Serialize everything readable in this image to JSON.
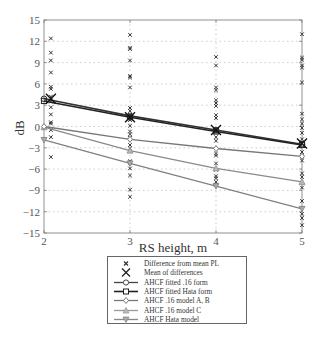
{
  "chart_data": {
    "type": "line",
    "title": "",
    "xlabel": "RS height, m",
    "ylabel": "dB",
    "xlim": [
      2,
      5
    ],
    "ylim": [
      -15,
      15
    ],
    "x_ticks": [
      2,
      3,
      4,
      5
    ],
    "y_ticks": [
      15,
      12,
      9,
      6,
      3,
      0,
      -3,
      -6,
      -9,
      -12,
      -15
    ],
    "y_tick_labels": [
      "15",
      "12",
      "9",
      "6",
      "3",
      "0",
      "−3",
      "−6",
      "−9",
      "−12",
      "−15"
    ],
    "grid": true,
    "x": [
      2,
      3,
      4,
      5
    ],
    "series": [
      {
        "name": "AHCF fitted .16 form",
        "marker": "circle",
        "color": "#333333",
        "values": [
          3.9,
          1.5,
          -0.5,
          -2.5
        ]
      },
      {
        "name": "AHCF fitted Hata form",
        "marker": "square",
        "color": "#222222",
        "values": [
          3.6,
          1.3,
          -0.7,
          -2.6
        ]
      },
      {
        "name": "AHCF .16 model A, B",
        "marker": "diamond",
        "color": "#777777",
        "values": [
          0.0,
          -1.8,
          -3.1,
          -4.2
        ]
      },
      {
        "name": "AHCF .16 model C",
        "marker": "triangle-up",
        "color": "#8a8a8a",
        "values": [
          -0.1,
          -3.4,
          -5.9,
          -7.8
        ]
      },
      {
        "name": "AHCF Hata model",
        "marker": "triangle-down",
        "color": "#808080",
        "values": [
          -1.9,
          -5.2,
          -8.4,
          -11.6
        ]
      }
    ],
    "mean_of_differences": {
      "name": "Mean of differences",
      "x": [
        2.08,
        3,
        4,
        5
      ],
      "values": [
        3.9,
        1.3,
        -0.5,
        -2.4
      ]
    },
    "scatter": {
      "name": "Difference from mean PL",
      "points": [
        {
          "x": 2.08,
          "values": [
            12.4,
            10.4,
            9.3,
            7.6,
            5.6,
            5.3,
            4.2,
            3.5,
            2.7,
            1.7,
            0.6,
            0.4,
            -0.5,
            -1.5,
            -4.3
          ]
        },
        {
          "x": 3,
          "values": [
            12.9,
            11.1,
            10.9,
            9.3,
            7.1,
            6.9,
            5.5,
            2.6,
            2.2,
            1.6,
            0.9,
            0.1,
            -0.7,
            -1.1,
            -1.6,
            -2.6,
            -3.1,
            -4.9,
            -5.1,
            -5.9,
            -6.9,
            -8.9,
            -9.9
          ]
        },
        {
          "x": 4,
          "values": [
            9.8,
            8.6,
            5.5,
            5.1,
            3.7,
            3.3,
            2.9,
            1.6,
            1.2,
            -0.4,
            -0.8,
            -1.5,
            -2.0,
            -3.8,
            -4.1,
            -5.2,
            -6.1,
            -7.0,
            -7.3,
            -7.8,
            -8.2
          ]
        },
        {
          "x": 5,
          "values": [
            13.0,
            9.7,
            9.4,
            8.6,
            8.3,
            6.2,
            1.8,
            1.0,
            0.4,
            -0.2,
            -0.9,
            -1.8,
            -3.6,
            -4.2,
            -4.8,
            -6.6,
            -7.1,
            -8.6,
            -10.5,
            -12.3,
            -12.9,
            -13.9
          ]
        }
      ]
    },
    "legend_position": "below"
  },
  "legend": {
    "items": [
      {
        "label": "Difference from mean PL"
      },
      {
        "label": "Mean of differences"
      },
      {
        "label": "AHCF fitted .16 form"
      },
      {
        "label": "AHCF fitted Hata form"
      },
      {
        "label": "AHCF .16 model A, B"
      },
      {
        "label": "AHCF .16 model C"
      },
      {
        "label": "AHCF Hata model"
      }
    ]
  }
}
